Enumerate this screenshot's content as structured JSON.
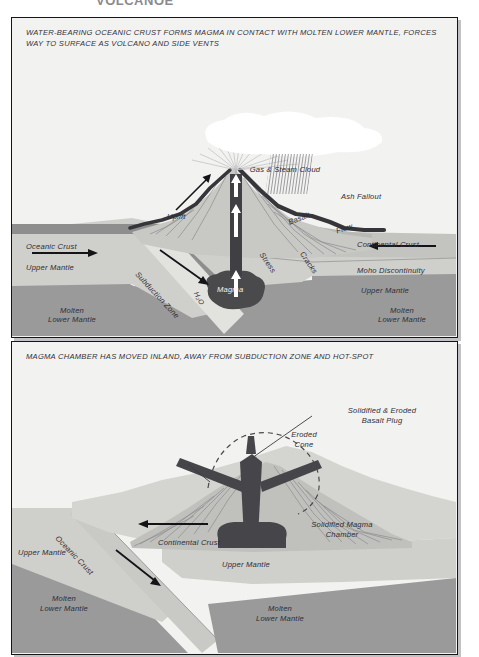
{
  "page": {
    "cropped_heading": "VOLCANOE",
    "background": "#ffffff"
  },
  "palette": {
    "panel_bg": "#f2f2f0",
    "border": "#16161a",
    "upper_mantle": "#cfcfcb",
    "molten_lower_mantle": "#9a9a9a",
    "oceanic_crust": "#8e8e8e",
    "continental_crust": "#c3c3bf",
    "volcano_body": "#b8b8b4",
    "magma_dark": "#4a4a4d",
    "basalt_flow": "#3a3a3d",
    "steam_cloud": "#ffffff",
    "text": "#2e2e36"
  },
  "panels": [
    {
      "id": "panel-1",
      "caption": "WATER-BEARING OCEANIC CRUST FORMS MAGMA IN CONTACT WITH MOLTEN LOWER MANTLE, FORCES WAY TO SURFACE AS VOLCANO AND SIDE VENTS",
      "labels": [
        {
          "key": "gas_steam_cloud",
          "text": "Gas & Steam Cloud"
        },
        {
          "key": "ash_fallout",
          "text": "Ash Fallout"
        },
        {
          "key": "uplift",
          "text": "Uplift"
        },
        {
          "key": "basalt",
          "text": "Basalt"
        },
        {
          "key": "flow",
          "text": "Flow"
        },
        {
          "key": "stress",
          "text": "Stress"
        },
        {
          "key": "cracks",
          "text": "Cracks"
        },
        {
          "key": "oceanic_crust",
          "text": "Oceanic Crust"
        },
        {
          "key": "upper_mantle_left",
          "text": "Upper Mantle"
        },
        {
          "key": "subduction_zone",
          "text": "Subduction Zone"
        },
        {
          "key": "h2o",
          "text": "H₂O"
        },
        {
          "key": "magma",
          "text": "Magma"
        },
        {
          "key": "molten_lower_left",
          "text": "Molten\nLower Mantle"
        },
        {
          "key": "continental_crust",
          "text": "Continental Crust"
        },
        {
          "key": "moho",
          "text": "Moho Discontinuity"
        },
        {
          "key": "upper_mantle_right",
          "text": "Upper Mantle"
        },
        {
          "key": "molten_lower_right",
          "text": "Molten\nLower Mantle"
        }
      ],
      "molten_lower_left_line1": "Molten",
      "molten_lower_left_line2": "Lower Mantle",
      "molten_lower_right_line1": "Molten",
      "molten_lower_right_line2": "Lower Mantle"
    },
    {
      "id": "panel-2",
      "caption": "MAGMA CHAMBER HAS MOVED INLAND, AWAY FROM SUBDUCTION ZONE AND HOT-SPOT",
      "labels": [
        {
          "key": "solidified_plug",
          "text": "Solidified & Eroded\nBasalt Plug"
        },
        {
          "key": "eroded_cone",
          "text": "Eroded\nCone"
        },
        {
          "key": "continental_crust",
          "text": "Continental Crust"
        },
        {
          "key": "oceanic_crust",
          "text": "Oceanic Crust"
        },
        {
          "key": "upper_mantle_left",
          "text": "Upper Mantle"
        },
        {
          "key": "upper_mantle_right",
          "text": "Upper Mantle"
        },
        {
          "key": "solidified_chamber",
          "text": "Solidified Magma\nChamber"
        },
        {
          "key": "molten_lower_left",
          "text": "Molten\nLower Mantle"
        },
        {
          "key": "molten_lower_right",
          "text": "Molten\nLower Mantle"
        }
      ],
      "solidified_plug_line1": "Solidified & Eroded",
      "solidified_plug_line2": "Basalt Plug",
      "eroded_cone_line1": "Eroded",
      "eroded_cone_line2": "Cone",
      "solidified_chamber_line1": "Solidified Magma",
      "solidified_chamber_line2": "Chamber",
      "molten_lower_left_line1": "Molten",
      "molten_lower_left_line2": "Lower Mantle",
      "molten_lower_right_line1": "Molten",
      "molten_lower_right_line2": "Lower Mantle"
    }
  ]
}
